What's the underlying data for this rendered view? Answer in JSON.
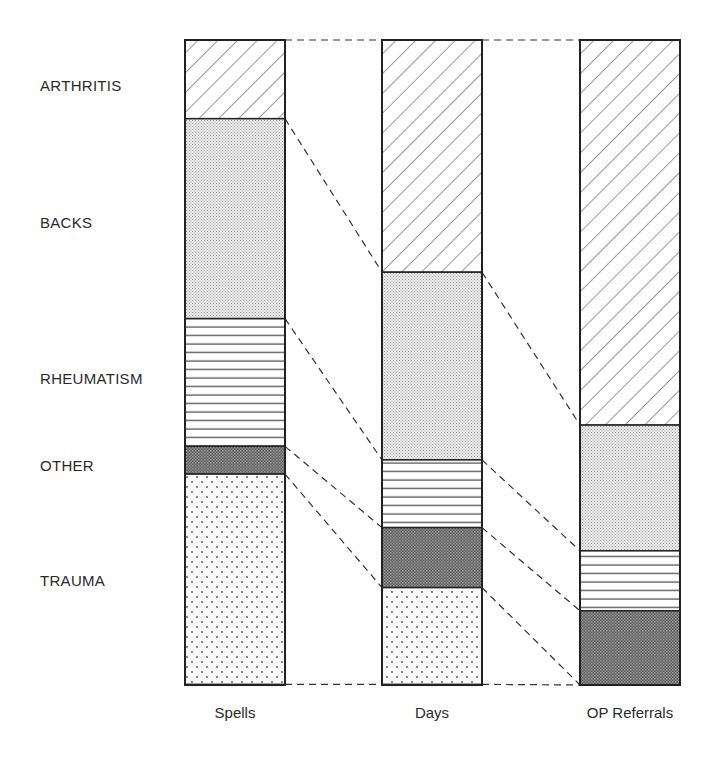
{
  "chart_data": {
    "type": "bar",
    "stacked": true,
    "normalized": true,
    "title": "",
    "xlabel": "",
    "ylabel": "",
    "ylim": [
      0,
      100
    ],
    "grid": false,
    "categories": [
      "Spells",
      "Days",
      "OP Referrals"
    ],
    "series": [
      {
        "name": "ARTHRITIS",
        "pattern": "diagonal-hatch",
        "values": [
          12.2,
          36.0,
          59.7
        ]
      },
      {
        "name": "BACKS",
        "pattern": "fine-stipple",
        "values": [
          31.0,
          29.1,
          19.5
        ]
      },
      {
        "name": "RHEUMATISM",
        "pattern": "horizontal-lines",
        "values": [
          19.8,
          10.5,
          9.3
        ]
      },
      {
        "name": "OTHER",
        "pattern": "dark-crosshatch",
        "values": [
          4.3,
          9.3,
          11.5
        ]
      },
      {
        "name": "TRAUMA",
        "pattern": "sparse-dots",
        "values": [
          32.6,
          15.0,
          0.0
        ]
      }
    ],
    "legend_position": "left, aligned with first bar segments",
    "connectors": "dashed lines join matching segment boundaries between adjacent bars"
  },
  "labels": {
    "categories": [
      "ARTHRITIS",
      "BACKS",
      "RHEUMATISM",
      "OTHER",
      "TRAUMA"
    ],
    "bars": [
      "Spells",
      "Days",
      "OP Referrals"
    ]
  }
}
